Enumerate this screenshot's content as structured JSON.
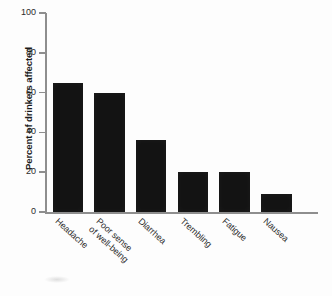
{
  "chart_data": {
    "type": "bar",
    "title": "",
    "xlabel": "",
    "ylabel": "Percent of drinkers affected",
    "ylim": [
      0,
      100
    ],
    "yticks": [
      0,
      20,
      40,
      60,
      80,
      100
    ],
    "grid": false,
    "legend": false,
    "categories": [
      "Headache",
      "Poor sense of well-being",
      "Diarrhea",
      "Trembling",
      "Fatigue",
      "Nausea"
    ],
    "category_lines": [
      [
        "Headache"
      ],
      [
        "Poor sense",
        "of well-being"
      ],
      [
        "Diarrhea"
      ],
      [
        "Trembling"
      ],
      [
        "Fatigue"
      ],
      [
        "Nausea"
      ]
    ],
    "values": [
      65,
      60,
      36,
      20,
      20,
      9
    ],
    "bar_color": "#131313",
    "axis_color": "#8e8e8e",
    "background_color": "#fdfdfd"
  }
}
